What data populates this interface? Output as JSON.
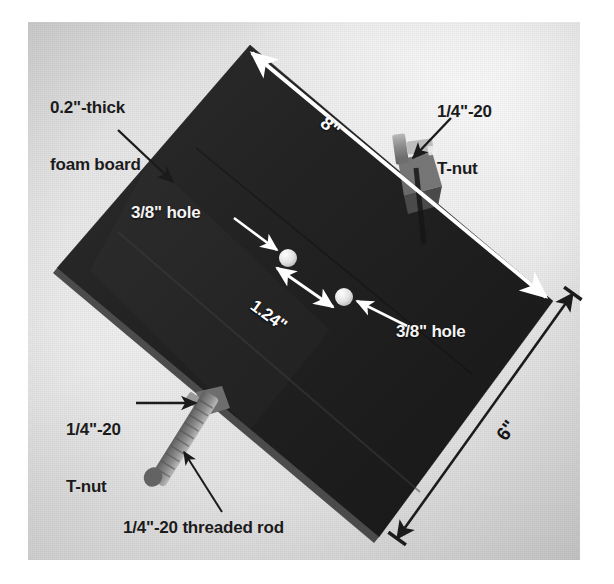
{
  "figure": {
    "media": "photograph with overlaid dimension annotations"
  },
  "annotations": {
    "foam_board": {
      "line1": "0.2\"-thick",
      "line2": "foam board",
      "color": "#1b1b1b",
      "style": "dark"
    },
    "tnut_top": {
      "line1": "1/4\"-20",
      "line2": "T-nut",
      "color": "#1b1b1b",
      "style": "dark"
    },
    "tnut_bottom": {
      "line1": "1/4\"-20",
      "line2": "T-nut",
      "color": "#1b1b1b",
      "style": "dark"
    },
    "threaded_rod": {
      "label": "1/4\"-20 threaded rod",
      "color": "#1b1b1b",
      "style": "dark"
    },
    "hole_upper": {
      "label": "3/8\" hole",
      "color": "#ffffff",
      "style": "light"
    },
    "hole_lower": {
      "label": "3/8\" hole",
      "color": "#ffffff",
      "style": "light"
    }
  },
  "dimensions": [
    {
      "name": "length",
      "label": "8\"",
      "value": 8,
      "unit": "in",
      "color": "#ffffff",
      "placement": "long-edge-top-right"
    },
    {
      "name": "width",
      "label": "6\"",
      "value": 6,
      "unit": "in",
      "color": "#1b1b1b",
      "placement": "outside-lower-right"
    },
    {
      "name": "hole-spacing",
      "label": "1.24\"",
      "value": 1.24,
      "unit": "in",
      "color": "#ffffff",
      "placement": "between-holes"
    }
  ],
  "parts": [
    {
      "name": "foam-board",
      "description": "black foam board",
      "thickness_in": 0.2,
      "length_in": 8,
      "width_in": 6
    },
    {
      "name": "hole-upper",
      "description": "3/8 inch through hole"
    },
    {
      "name": "hole-lower",
      "description": "3/8 inch through hole"
    },
    {
      "name": "t-nut-top",
      "description": "1/4\"-20 T-nut on upper right edge"
    },
    {
      "name": "t-nut-bottom",
      "description": "1/4\"-20 T-nut on lower left edge"
    },
    {
      "name": "threaded-rod",
      "description": "1/4\"-20 threaded rod"
    }
  ],
  "palette": {
    "board": "#232323",
    "board_edge": "#3a3a3a",
    "background_light": "#efefef",
    "background_dark": "#d5d5d5",
    "metal": "#8e8e8e",
    "hole_fill": "#e8e8e8",
    "annotation_dark": "#1b1b1b",
    "annotation_light": "#ffffff"
  }
}
